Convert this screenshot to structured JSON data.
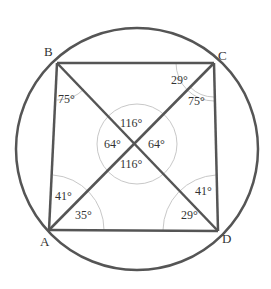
{
  "figure": {
    "type": "cyclic-quadrilateral",
    "colors": {
      "stroke": "#555555",
      "arc": "#bbbbbb",
      "text": "#333333",
      "background": "#ffffff"
    },
    "circumcircle": {
      "cx": 137,
      "cy": 149,
      "r": 121
    },
    "center_circle": {
      "cx": 137,
      "cy": 144,
      "r": 40
    },
    "points": {
      "A": {
        "label": "A",
        "x": 49,
        "y": 230
      },
      "B": {
        "label": "B",
        "x": 57,
        "y": 63
      },
      "C": {
        "label": "C",
        "x": 214,
        "y": 63
      },
      "D": {
        "label": "D",
        "x": 218,
        "y": 231
      }
    },
    "angles": {
      "B_angle": "75°",
      "C_top": "29°",
      "C_bottom": "75°",
      "center_top": "116°",
      "center_left": "64°",
      "center_right": "64°",
      "center_bottom": "116°",
      "A_top": "41°",
      "A_bottom": "35°",
      "D_top": "41°",
      "D_bottom": "29°"
    }
  }
}
